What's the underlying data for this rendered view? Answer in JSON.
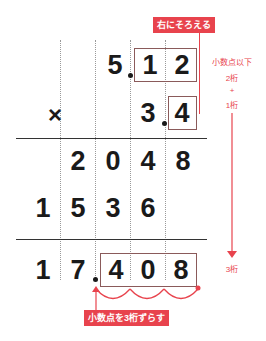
{
  "diagram": {
    "multiplicand": {
      "int": "5",
      "frac": [
        "1",
        "2"
      ]
    },
    "operator": "×",
    "multiplier": {
      "int": "3",
      "frac": [
        "4"
      ]
    },
    "partial1": [
      "2",
      "0",
      "4",
      "8"
    ],
    "partial2": [
      "1",
      "5",
      "3",
      "6"
    ],
    "result": {
      "int": [
        "1",
        "7"
      ],
      "frac": [
        "4",
        "0",
        "8"
      ]
    },
    "labels": {
      "align_right": "右にそろえる",
      "decimal_places_heading": "小数点以下",
      "places_a": "2桁",
      "plus": "+",
      "places_b": "1桁",
      "places_total": "3桁",
      "shift_decimal": "小数点を3桁ずらす"
    },
    "colors": {
      "accent": "#e8434d",
      "text": "#1a1a1a"
    }
  }
}
